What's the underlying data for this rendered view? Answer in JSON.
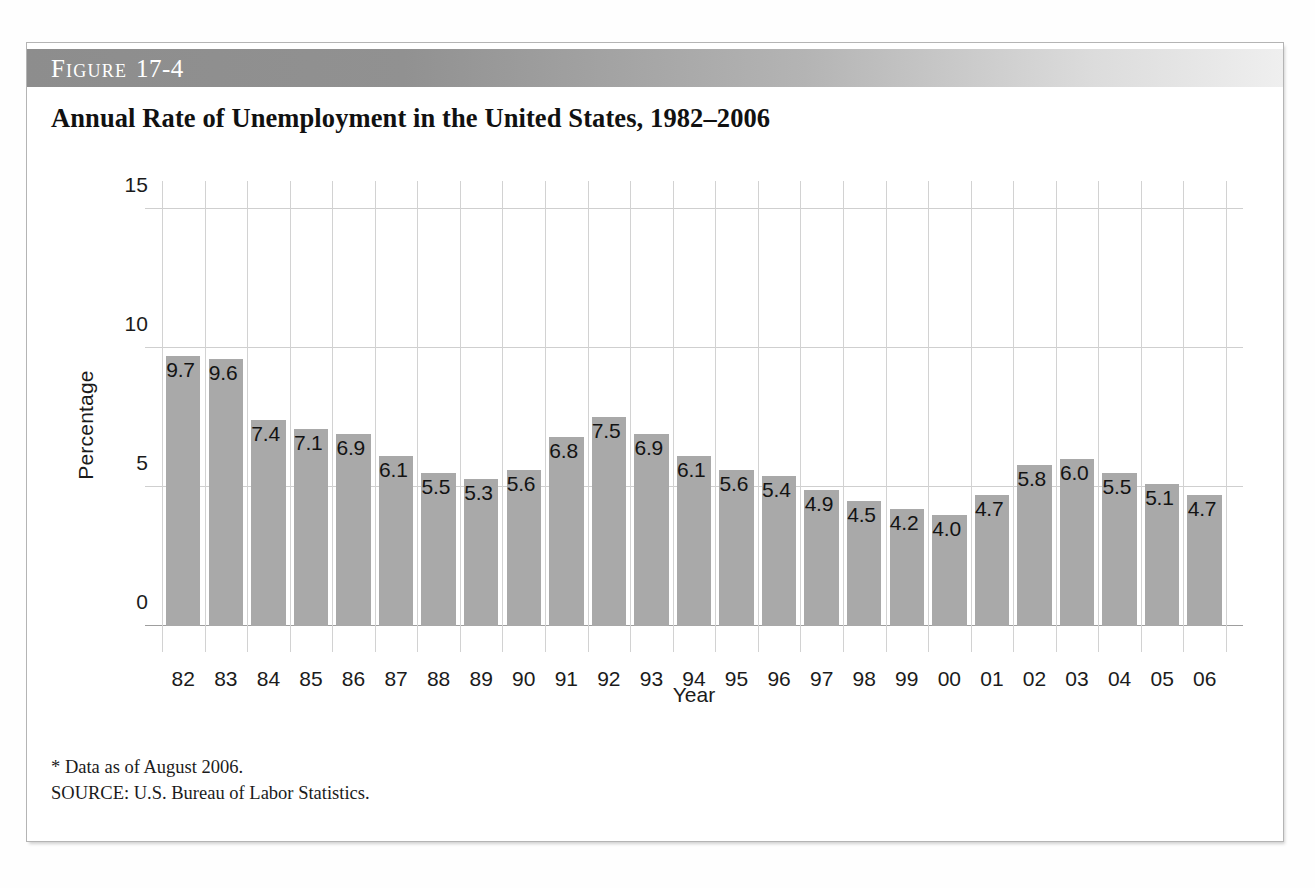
{
  "figure": {
    "banner_label": "Figure",
    "banner_number": "17-4",
    "title": "Annual Rate of Unemployment in the United States, 1982–2006"
  },
  "footnotes": [
    "* Data as of August 2006.",
    "SOURCE: U.S. Bureau of Labor Statistics."
  ],
  "colors": {
    "bar_fill": "#a9a9a9",
    "banner_dark": "#8d8d8d",
    "banner_light": "#efefef",
    "gridline": "#d2d2d2",
    "axis_line": "#9e9e9e",
    "frame_border": "#b4b4b4",
    "text": "#1b1b1b"
  },
  "chart_data": {
    "type": "bar",
    "title": "Annual Rate of Unemployment in the United States, 1982–2006",
    "xlabel": "Year",
    "ylabel": "Percentage",
    "categories": [
      "82",
      "83",
      "84",
      "85",
      "86",
      "87",
      "88",
      "89",
      "90",
      "91",
      "92",
      "93",
      "94",
      "95",
      "96",
      "97",
      "98",
      "99",
      "00",
      "01",
      "02",
      "03",
      "04",
      "05",
      "06"
    ],
    "values": [
      9.7,
      9.6,
      7.4,
      7.1,
      6.9,
      6.1,
      5.5,
      5.3,
      5.6,
      6.8,
      7.5,
      6.9,
      6.1,
      5.6,
      5.4,
      4.9,
      4.5,
      4.2,
      4.0,
      4.7,
      5.8,
      6.0,
      5.5,
      5.1,
      4.7
    ],
    "data_labels": [
      "9.7",
      "9.6",
      "7.4",
      "7.1",
      "6.9",
      "6.1",
      "5.5",
      "5.3",
      "5.6",
      "6.8",
      "7.5",
      "6.9",
      "6.1",
      "5.6",
      "5.4",
      "4.9",
      "4.5",
      "4.2",
      "4.0",
      "4.7",
      "5.8",
      "6.0",
      "5.5",
      "5.1",
      "4.7"
    ],
    "ylim": [
      0,
      16
    ],
    "yticks": [
      0,
      5,
      10,
      15
    ],
    "ytick_labels": [
      "0",
      "5",
      "10",
      "15"
    ],
    "grid": "both",
    "legend": "none"
  }
}
